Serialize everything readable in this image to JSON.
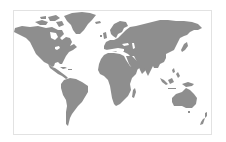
{
  "map": {
    "title": "World map",
    "projection": "equirectangular",
    "colors": {
      "land": "#8e8e8e",
      "water": "#ffffff",
      "frame": "#e2e2e2"
    },
    "regions": [
      {
        "name": "North America",
        "id": "north-america"
      },
      {
        "name": "Greenland",
        "id": "greenland"
      },
      {
        "name": "Canadian Arctic Archipelago",
        "id": "arctic-islands"
      },
      {
        "name": "Central America",
        "id": "central-america"
      },
      {
        "name": "Caribbean",
        "id": "caribbean"
      },
      {
        "name": "South America",
        "id": "south-america"
      },
      {
        "name": "Iceland",
        "id": "iceland"
      },
      {
        "name": "United Kingdom",
        "id": "uk"
      },
      {
        "name": "Europe",
        "id": "europe"
      },
      {
        "name": "Scandinavia",
        "id": "scandinavia"
      },
      {
        "name": "Asia",
        "id": "asia"
      },
      {
        "name": "Africa",
        "id": "africa"
      },
      {
        "name": "Madagascar",
        "id": "madagascar"
      },
      {
        "name": "Arabian Peninsula",
        "id": "arabia"
      },
      {
        "name": "India",
        "id": "india"
      },
      {
        "name": "Japan",
        "id": "japan"
      },
      {
        "name": "Southeast Asia Islands",
        "id": "se-asia-islands"
      },
      {
        "name": "New Guinea",
        "id": "new-guinea"
      },
      {
        "name": "Australia",
        "id": "australia"
      },
      {
        "name": "New Zealand",
        "id": "new-zealand"
      }
    ]
  }
}
